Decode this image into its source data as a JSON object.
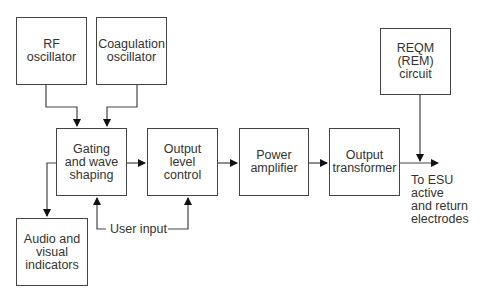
{
  "diagram": {
    "blocks": {
      "rf_oscillator": "RF\noscillator",
      "coagulation_oscillator": "Coagulation\noscillator",
      "gating": "Gating\nand wave\nshaping",
      "output_level": "Output\nlevel\ncontrol",
      "power_amplifier": "Power\namplifier",
      "output_transformer": "Output\ntransformer",
      "reqm": "REQM\n(REM)\ncircuit",
      "audio_visual": "Audio and\nvisual\nindicators"
    },
    "labels": {
      "user_input": "User input",
      "output_destination": "To ESU active\nand return\nelectrodes"
    }
  }
}
